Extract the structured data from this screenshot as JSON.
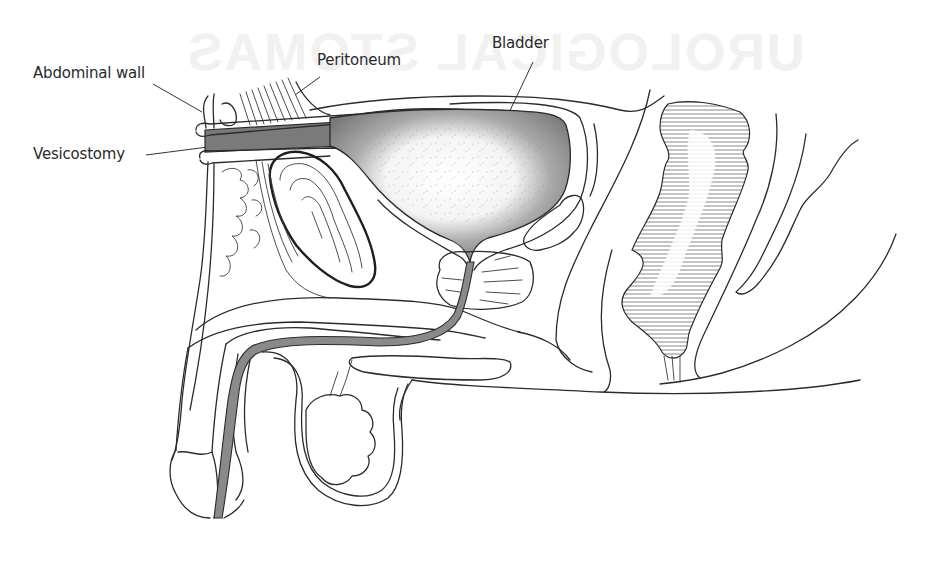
{
  "figure": {
    "background_title": "UROLOGICAL STOMAS",
    "type": "anatomical-cross-section"
  },
  "labels": [
    {
      "id": "abdominal-wall",
      "text": "Abdominal wall",
      "x": 33,
      "y": 64
    },
    {
      "id": "peritoneum",
      "text": "Peritoneum",
      "x": 197,
      "y": 51
    },
    {
      "id": "bladder",
      "text": "Bladder",
      "x": 294,
      "y": 34
    },
    {
      "id": "vesicostomy",
      "text": "Vesicostomy",
      "x": 33,
      "y": 145
    }
  ],
  "colors": {
    "ink": "#2b2b2b",
    "bladder_wall": "#7a7a7a",
    "urethra_fill": "#8a8a8a",
    "bladder_lumen": "#ffffff",
    "hatching": "#555555",
    "background": "#ffffff"
  }
}
